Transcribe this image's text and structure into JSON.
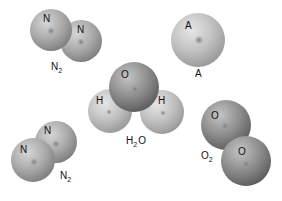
{
  "diagram": {
    "type": "molecular-models",
    "colors": {
      "light_atom": "#c4c4c4",
      "medium_atom": "#a8a8a8",
      "dark_atom": "#8a8a8a",
      "nucleus": "#8c8c8c",
      "text": "#111111"
    },
    "molecules": [
      {
        "id": "n2-top",
        "formula_main": "N",
        "formula_sub": "2",
        "formula_tail": "",
        "atoms": [
          {
            "symbol": "N"
          },
          {
            "symbol": "N"
          }
        ]
      },
      {
        "id": "argon",
        "formula_main": "A",
        "formula_sub": "",
        "formula_tail": "",
        "atoms": [
          {
            "symbol": "A"
          }
        ]
      },
      {
        "id": "water",
        "formula_main": "H",
        "formula_sub": "2",
        "formula_tail": "O",
        "atoms": [
          {
            "symbol": "H"
          },
          {
            "symbol": "H"
          },
          {
            "symbol": "O"
          }
        ]
      },
      {
        "id": "n2-bottom",
        "formula_main": "N",
        "formula_sub": "2",
        "formula_tail": "",
        "atoms": [
          {
            "symbol": "N"
          },
          {
            "symbol": "N"
          }
        ]
      },
      {
        "id": "o2",
        "formula_main": "O",
        "formula_sub": "2",
        "formula_tail": "",
        "atoms": [
          {
            "symbol": "O"
          },
          {
            "symbol": "O"
          }
        ]
      }
    ]
  }
}
